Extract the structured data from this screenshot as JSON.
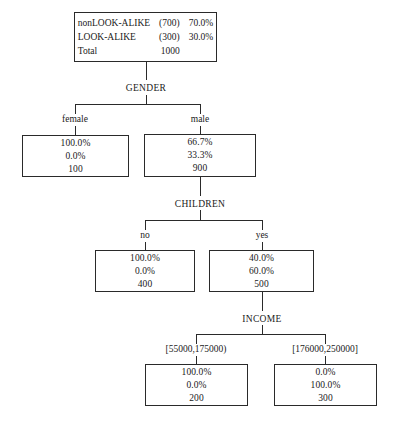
{
  "diagram": {
    "type": "decision-tree",
    "root": {
      "rows": [
        {
          "label": "nonLOOK-ALIKE",
          "count": "(700)",
          "pct": "70.0%"
        },
        {
          "label": "LOOK-ALIKE",
          "count": "(300)",
          "pct": "30.0%"
        },
        {
          "label": "Total",
          "count": "1000",
          "pct": ""
        }
      ]
    },
    "splits": [
      {
        "name": "gender",
        "label": "GENDER"
      },
      {
        "name": "children",
        "label": "CHILDREN"
      },
      {
        "name": "income",
        "label": "INCOME"
      }
    ],
    "branches": [
      {
        "name": "female",
        "label": "female"
      },
      {
        "name": "male",
        "label": "male"
      },
      {
        "name": "no",
        "label": "no"
      },
      {
        "name": "yes",
        "label": "yes"
      },
      {
        "name": "income-low",
        "label": "[55000,175000)"
      },
      {
        "name": "income-high",
        "label": "[176000,250000]"
      }
    ],
    "nodes": [
      {
        "name": "female",
        "pct_nonlookalike": "100.0%",
        "pct_lookalike": "0.0%",
        "total": "100"
      },
      {
        "name": "male",
        "pct_nonlookalike": "66.7%",
        "pct_lookalike": "33.3%",
        "total": "900"
      },
      {
        "name": "children-no",
        "pct_nonlookalike": "100.0%",
        "pct_lookalike": "0.0%",
        "total": "400"
      },
      {
        "name": "children-yes",
        "pct_nonlookalike": "40.0%",
        "pct_lookalike": "60.0%",
        "total": "500"
      },
      {
        "name": "income-low",
        "pct_nonlookalike": "100.0%",
        "pct_lookalike": "0.0%",
        "total": "200"
      },
      {
        "name": "income-high",
        "pct_nonlookalike": "0.0%",
        "pct_lookalike": "100.0%",
        "total": "300"
      }
    ],
    "colors": {
      "stroke": "#2a2a2a",
      "text": "#1a1a1a",
      "background": "#ffffff"
    }
  }
}
